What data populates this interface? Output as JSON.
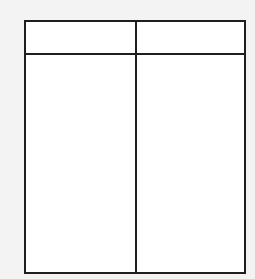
{
  "diagram": {
    "type": "t-chart",
    "columns": [
      {
        "header": "",
        "body": ""
      },
      {
        "header": "",
        "body": ""
      }
    ],
    "colors": {
      "line": "#1e1e1e",
      "fill": "#ffffff",
      "background": "#f3f3f3"
    }
  }
}
